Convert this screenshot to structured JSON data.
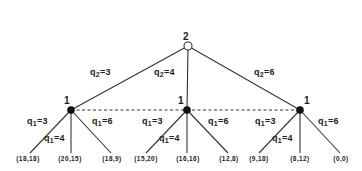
{
  "diagram": {
    "type": "extensive-form game tree",
    "root": {
      "player": "2",
      "marker": "open-circle",
      "actions": [
        {
          "var": "q",
          "sub": "2",
          "value": "=3"
        },
        {
          "var": "q",
          "sub": "2",
          "value": "=4"
        },
        {
          "var": "q",
          "sub": "2",
          "value": "=6"
        }
      ]
    },
    "information_set": {
      "style": "dashed",
      "connects": [
        "left",
        "middle",
        "right"
      ]
    },
    "player1_nodes": [
      {
        "player": "1",
        "actions": [
          {
            "var": "q",
            "sub": "1",
            "value": "=3"
          },
          {
            "var": "q",
            "sub": "1",
            "value": "=4"
          },
          {
            "var": "q",
            "sub": "1",
            "value": "=6"
          }
        ],
        "payoffs": [
          "(18,18)",
          "(20,15)",
          "(18,9)"
        ]
      },
      {
        "player": "1",
        "actions": [
          {
            "var": "q",
            "sub": "1",
            "value": "=3"
          },
          {
            "var": "q",
            "sub": "1",
            "value": "=4"
          },
          {
            "var": "q",
            "sub": "1",
            "value": "=6"
          }
        ],
        "payoffs": [
          "(15,20)",
          "(16,16)",
          "(12,8)"
        ]
      },
      {
        "player": "1",
        "actions": [
          {
            "var": "q",
            "sub": "1",
            "value": "=3"
          },
          {
            "var": "q",
            "sub": "1",
            "value": "=4"
          },
          {
            "var": "q",
            "sub": "1",
            "value": "=6"
          }
        ],
        "payoffs": [
          "(9,18)",
          "(8,12)",
          "(0,0)"
        ]
      }
    ],
    "colors": {
      "line": "#333333",
      "text": "#222222",
      "background": "#ffffff"
    }
  }
}
